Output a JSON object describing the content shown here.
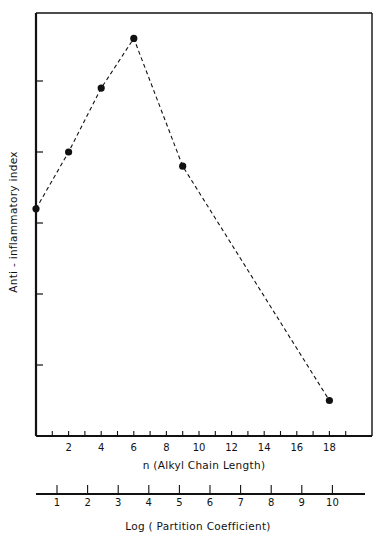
{
  "chart_data": {
    "type": "line",
    "title": "",
    "xlabel": "n (Alkyl Chain Length)",
    "ylabel": "Anti - inflammatory index",
    "secondary_xlabel": "Log ( Partition Coefficient)",
    "x_ticks": [
      2,
      4,
      6,
      8,
      10,
      12,
      14,
      16,
      18
    ],
    "x_minor_ticks": [
      1,
      2,
      3,
      4,
      5,
      6,
      7,
      8,
      9,
      10,
      11,
      12,
      13,
      14,
      15,
      16,
      17,
      18,
      19
    ],
    "secondary_x_ticks": [
      1,
      2,
      3,
      4,
      5,
      6,
      7,
      8,
      9,
      10
    ],
    "y_ticks_unlabeled": [
      1,
      2,
      3,
      4,
      5
    ],
    "xlim": [
      0,
      20
    ],
    "ylim": [
      0,
      6
    ],
    "grid": false,
    "legend": null,
    "line_style": "dashed",
    "marker": "filled-circle",
    "series": [
      {
        "name": "Anti-inflammatory index",
        "x": [
          0,
          2,
          4,
          6,
          9,
          18
        ],
        "values": [
          3.2,
          4.0,
          4.9,
          5.6,
          3.8,
          0.5
        ]
      }
    ]
  },
  "labels": {
    "xlabel": "n (Alkyl Chain Length)",
    "ylabel": "Anti - inflammatory index",
    "secondary_xlabel": "Log ( Partition Coefficient)",
    "x_tick_labels": [
      "2",
      "4",
      "6",
      "8",
      "10",
      "12",
      "14",
      "16",
      "18"
    ],
    "secondary_tick_labels": [
      "1",
      "2",
      "3",
      "4",
      "5",
      "6",
      "7",
      "8",
      "9",
      "10"
    ]
  }
}
